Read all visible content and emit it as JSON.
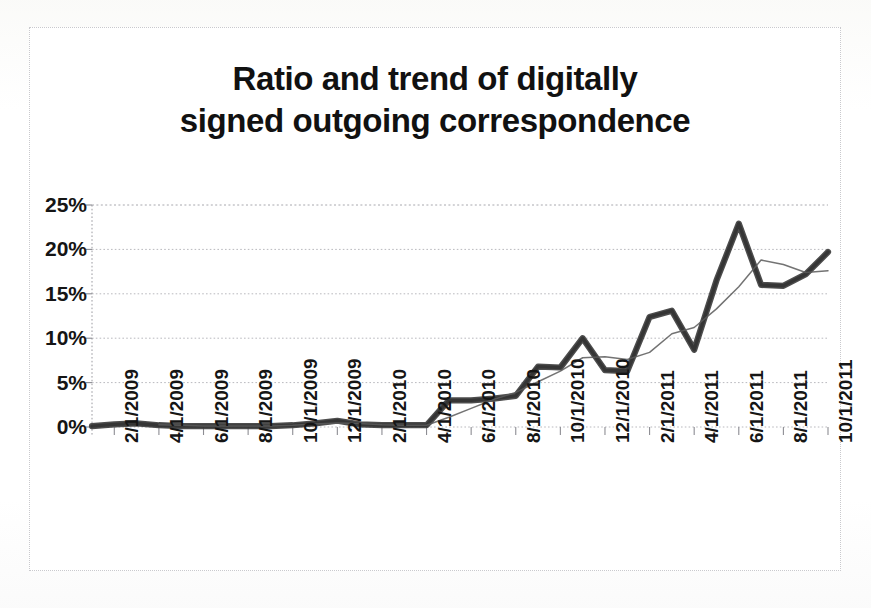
{
  "figure": {
    "title_line_1": "Ratio and trend of digitally",
    "title_line_2": "signed outgoing correspondence"
  },
  "axis": {
    "y_ticks": [
      "0%",
      "5%",
      "10%",
      "15%",
      "20%",
      "25%"
    ],
    "x_ticks": [
      "2/1/2009",
      "4/1/2009",
      "6/1/2009",
      "8/1/2009",
      "10/1/2009",
      "12/1/2009",
      "2/1/2010",
      "4/1/2010",
      "6/1/2010",
      "8/1/2010",
      "10/1/2010",
      "12/1/2010",
      "2/1/2011",
      "4/1/2011",
      "6/1/2011",
      "8/1/2011",
      "10/1/2011"
    ]
  },
  "colors": {
    "data_series": "#2b2b2b",
    "trend_series": "#5b5b5b",
    "gridline": "#b9b9be",
    "frame": "#c9c9cd",
    "background": "#ffffff",
    "text": "#151515"
  },
  "chart_data": {
    "type": "line",
    "title": "Ratio and trend of digitally signed outgoing correspondence",
    "xlabel": "",
    "ylabel": "",
    "ylim": [
      0,
      25
    ],
    "y_unit": "%",
    "grid": true,
    "legend": "none",
    "x": [
      "1/1/2009",
      "2/1/2009",
      "3/1/2009",
      "4/1/2009",
      "5/1/2009",
      "6/1/2009",
      "7/1/2009",
      "8/1/2009",
      "9/1/2009",
      "10/1/2009",
      "11/1/2009",
      "12/1/2009",
      "1/1/2010",
      "2/1/2010",
      "3/1/2010",
      "4/1/2010",
      "5/1/2010",
      "6/1/2010",
      "7/1/2010",
      "8/1/2010",
      "9/1/2010",
      "10/1/2010",
      "11/1/2010",
      "12/1/2010",
      "1/1/2011",
      "2/1/2011",
      "3/1/2011",
      "4/1/2011",
      "5/1/2011",
      "6/1/2011",
      "7/1/2011",
      "8/1/2011",
      "9/1/2011",
      "10/1/2011"
    ],
    "series": [
      {
        "name": "Ratio of digitally signed outgoing correspondence",
        "style": "thick-solid",
        "values": [
          0.1,
          0.3,
          0.4,
          0.2,
          0.1,
          0.1,
          0.1,
          0.1,
          0.1,
          0.2,
          0.4,
          0.7,
          0.3,
          0.2,
          0.2,
          0.2,
          3.0,
          3.0,
          3.2,
          3.5,
          6.8,
          6.7,
          10.0,
          6.4,
          6.3,
          12.4,
          13.1,
          8.7,
          16.5,
          22.9,
          16.0,
          15.9,
          17.2,
          19.7
        ]
      },
      {
        "name": "Trend (moving average)",
        "style": "thin-solid",
        "values": [
          null,
          null,
          null,
          0.25,
          0.2,
          0.12,
          0.1,
          0.1,
          0.12,
          0.2,
          0.35,
          0.45,
          0.4,
          0.25,
          0.2,
          0.2,
          1.1,
          2.1,
          3.1,
          3.9,
          5.1,
          6.3,
          7.8,
          7.9,
          7.6,
          8.4,
          10.5,
          11.2,
          13.3,
          15.8,
          18.8,
          18.3,
          17.4,
          17.6
        ]
      }
    ]
  }
}
